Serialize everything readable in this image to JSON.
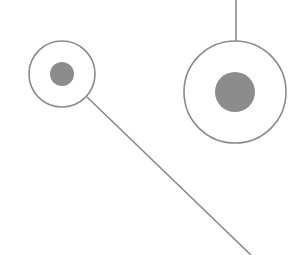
{
  "diagram": {
    "stroke_color": "#8a8a8a",
    "fill_color": "#8c8c8c",
    "background": "#ffffff",
    "nodes": [
      {
        "id": "small-node",
        "cx": 62,
        "cy": 74,
        "outer_r": 33,
        "inner_r": 12
      },
      {
        "id": "large-node",
        "cx": 235,
        "cy": 92,
        "outer_r": 51,
        "inner_r": 20
      }
    ],
    "edges": [
      {
        "id": "top-connector",
        "x1": 236,
        "y1": 0,
        "x2": 236,
        "y2": 41
      },
      {
        "id": "diagonal-connector",
        "x1": 87,
        "y1": 97,
        "x2": 251,
        "y2": 255
      }
    ]
  }
}
